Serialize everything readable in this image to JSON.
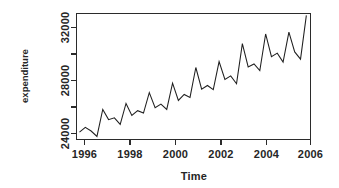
{
  "chart_data": {
    "type": "line",
    "title": "",
    "xlabel": "Time",
    "ylabel": "expenditure",
    "xlim": [
      1995.85,
      2005.95
    ],
    "ylim": [
      23400,
      34000
    ],
    "grid": false,
    "legend": null,
    "x_ticks": [
      1996,
      1998,
      2000,
      2002,
      2004,
      2006
    ],
    "x_tick_labels": [
      "1996",
      "1998",
      "2000",
      "2002",
      "2004",
      "2006"
    ],
    "x_minor_ticks": [],
    "y_ticks": [
      24000,
      26000,
      28000,
      30000,
      32000
    ],
    "y_tick_labels": [
      "24000",
      "",
      "28000",
      "",
      "32000"
    ],
    "y_labeled_ticks": [
      24000,
      28000,
      32000
    ],
    "series": [
      {
        "name": "expenditure",
        "frequency": "quarterly",
        "x": [
          1996.0,
          1996.25,
          1996.5,
          1996.75,
          1997.0,
          1997.25,
          1997.5,
          1997.75,
          1998.0,
          1998.25,
          1998.5,
          1998.75,
          1999.0,
          1999.25,
          1999.5,
          1999.75,
          2000.0,
          2000.25,
          2000.5,
          2000.75,
          2001.0,
          2001.25,
          2001.5,
          2001.75,
          2002.0,
          2002.25,
          2002.5,
          2002.75,
          2003.0,
          2003.25,
          2003.5,
          2003.75,
          2004.0,
          2004.25,
          2004.5,
          2004.75,
          2005.0,
          2005.25,
          2005.5,
          2005.75
        ],
        "values": [
          24050,
          24450,
          24150,
          23700,
          25950,
          25100,
          25250,
          24700,
          26450,
          25450,
          25850,
          25650,
          27350,
          26100,
          26400,
          25950,
          28150,
          26700,
          27200,
          26950,
          29450,
          27650,
          27950,
          27600,
          29950,
          28450,
          28750,
          28100,
          31450,
          29500,
          29750,
          29200,
          32250,
          30350,
          30650,
          29900,
          32400,
          30750,
          30150,
          33800
        ]
      }
    ]
  },
  "plot_box": {
    "left": 76,
    "top": 13,
    "right": 311,
    "bottom": 140
  },
  "axis_titles": {
    "x": "Time",
    "y": "expenditure"
  }
}
